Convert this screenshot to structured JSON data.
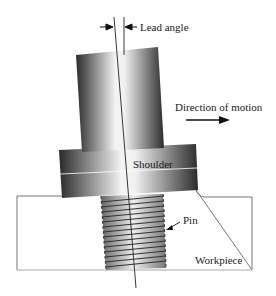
{
  "diagram": {
    "labels": {
      "lead_angle": "Lead angle",
      "direction": "Direction of motion",
      "shoulder": "Shoulder",
      "pin": "Pin",
      "workpiece": "Workpiece"
    },
    "components": [
      "tool-shank",
      "shoulder",
      "threaded-pin",
      "workpiece",
      "tool-axis",
      "vertical-reference"
    ],
    "colors": {
      "metal_dark": "#2a2a2a",
      "metal_light": "#f2f2f2",
      "outline": "#555555",
      "text": "#1a1a1a"
    }
  }
}
